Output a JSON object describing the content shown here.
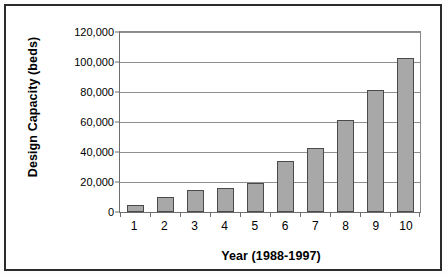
{
  "chart_data": {
    "type": "bar",
    "title": "",
    "xlabel": "Year (1988-1997)",
    "ylabel": "Design Capacity (beds)",
    "categories": [
      "1",
      "2",
      "3",
      "4",
      "5",
      "6",
      "7",
      "8",
      "9",
      "10"
    ],
    "values": [
      4500,
      10000,
      15000,
      16000,
      19500,
      34000,
      42500,
      61500,
      81500,
      103000
    ],
    "ylim": [
      0,
      120000
    ],
    "ytick_labels": [
      "120,000",
      "100,000",
      "80,000",
      "60,000",
      "40,000",
      "20,000",
      "0"
    ],
    "ytick_values": [
      120000,
      100000,
      80000,
      60000,
      40000,
      20000,
      0
    ],
    "grid": "horizontal",
    "legend": "none",
    "series_color": "#a8a8a8",
    "series_outline_color": "#4a4a4a",
    "plot_background": "#ffffff",
    "frame_color": "#2b2b2b",
    "axis_color": "#6e6e6e",
    "gridline_color": "#8f8f8f"
  }
}
